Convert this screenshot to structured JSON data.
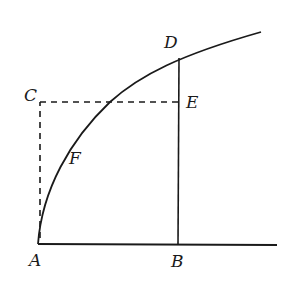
{
  "diagram": {
    "type": "geometric-figure",
    "labels": {
      "A": "A",
      "B": "B",
      "C": "C",
      "D": "D",
      "E": "E",
      "F": "F"
    },
    "colors": {
      "ink": "#1a1a1a",
      "background": "#ffffff"
    }
  }
}
